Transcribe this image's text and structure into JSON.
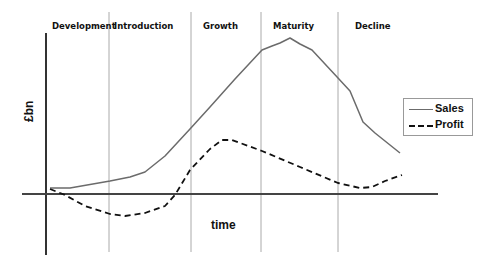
{
  "chart_data": {
    "type": "line",
    "xlabel": "time",
    "ylabel": "£bn",
    "grid": false,
    "legend_position": "right",
    "stages": [
      "Development",
      "Introduction",
      "Growth",
      "Maturity",
      "Decline"
    ],
    "stage_boundaries_px": [
      109,
      191,
      261,
      338
    ],
    "axis": {
      "y_axis_x": 46,
      "y_top": 33,
      "y_bottom": 255,
      "x_axis_y": 194,
      "x_left": 22,
      "x_right": 438
    },
    "series": [
      {
        "name": "Sales",
        "style": "solid",
        "color": "#6b6b6b",
        "points_px": [
          [
            50,
            188
          ],
          [
            70,
            188
          ],
          [
            110,
            181
          ],
          [
            130,
            177
          ],
          [
            145,
            172
          ],
          [
            165,
            156
          ],
          [
            190,
            129
          ],
          [
            210,
            107
          ],
          [
            235,
            79
          ],
          [
            262,
            50
          ],
          [
            272,
            46
          ],
          [
            280,
            43
          ],
          [
            290,
            38
          ],
          [
            300,
            44
          ],
          [
            312,
            50
          ],
          [
            325,
            64
          ],
          [
            338,
            78
          ],
          [
            350,
            91
          ],
          [
            363,
            122
          ],
          [
            375,
            133
          ],
          [
            400,
            153
          ]
        ]
      },
      {
        "name": "Profit",
        "style": "dashed",
        "color": "#111111",
        "points_px": [
          [
            50,
            189
          ],
          [
            65,
            195
          ],
          [
            85,
            206
          ],
          [
            110,
            214
          ],
          [
            125,
            216
          ],
          [
            145,
            213
          ],
          [
            165,
            206
          ],
          [
            175,
            195
          ],
          [
            190,
            170
          ],
          [
            210,
            149
          ],
          [
            222,
            140
          ],
          [
            232,
            140
          ],
          [
            262,
            151
          ],
          [
            300,
            167
          ],
          [
            338,
            183
          ],
          [
            360,
            188
          ],
          [
            372,
            187
          ],
          [
            385,
            181
          ],
          [
            402,
            175
          ]
        ]
      }
    ]
  },
  "labels": {
    "stages": [
      "Development",
      "Introduction",
      "Growth",
      "Maturity",
      "Decline"
    ],
    "ylabel": "£bn",
    "xlabel": "time",
    "legend": [
      "Sales",
      "Profit"
    ]
  },
  "colors": {
    "sales": "#6b6b6b",
    "profit": "#111111",
    "axis": "#333333",
    "divider": "#aaaaaa"
  }
}
